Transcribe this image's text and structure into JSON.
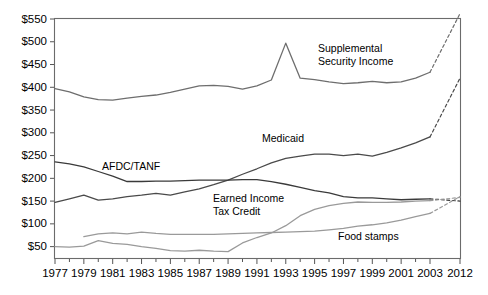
{
  "chart_data": {
    "type": "line",
    "title": "",
    "subtitle": "",
    "xlabel": "",
    "ylabel": "",
    "xlim": [
      1977,
      2012
    ],
    "ylim": [
      25,
      550
    ],
    "grid": false,
    "legend_position": "inline-labels",
    "ytick_labels": [
      "$50",
      "$100",
      "$150",
      "$200",
      "$250",
      "$300",
      "$350",
      "$400",
      "$450",
      "$500",
      "$550"
    ],
    "ytick_values": [
      50,
      100,
      150,
      200,
      250,
      300,
      350,
      400,
      450,
      500,
      550
    ],
    "xtick_labels": [
      "1977",
      "1979",
      "1981",
      "1983",
      "1985",
      "1987",
      "1989",
      "1991",
      "1993",
      "1995",
      "1997",
      "1999",
      "2001",
      "2003",
      "2012"
    ],
    "xtick_values": [
      1977,
      1979,
      1981,
      1983,
      1985,
      1987,
      1989,
      1991,
      1993,
      1995,
      1997,
      1999,
      2001,
      2003,
      2012
    ],
    "x_minor_ticks": [
      1978,
      1980,
      1982,
      1984,
      1986,
      1988,
      1990,
      1992,
      1994,
      1996,
      1998,
      2000,
      2002
    ],
    "note_projection": "Dashed segments from 2003 to 2012 are projections",
    "series": [
      {
        "name": "Supplemental Security Income",
        "label": "Supplemental Security Income",
        "color": "#6e6e6e",
        "x": [
          1977,
          1978,
          1979,
          1980,
          1981,
          1982,
          1983,
          1984,
          1985,
          1986,
          1987,
          1988,
          1989,
          1990,
          1991,
          1992,
          1993,
          1994,
          1995,
          1996,
          1997,
          1998,
          1999,
          2000,
          2001,
          2002,
          2003
        ],
        "values": [
          397,
          390,
          379,
          373,
          372,
          376,
          380,
          383,
          389,
          396,
          403,
          404,
          402,
          396,
          403,
          416,
          497,
          420,
          417,
          412,
          408,
          410,
          413,
          410,
          412,
          420,
          433
        ],
        "projection_x": [
          2003,
          2012
        ],
        "projection_values": [
          433,
          562
        ]
      },
      {
        "name": "Medicaid",
        "label": "Medicaid",
        "color": "#4a4a4a",
        "x": [
          1977,
          1978,
          1979,
          1980,
          1981,
          1982,
          1983,
          1984,
          1985,
          1986,
          1987,
          1988,
          1989,
          1990,
          1991,
          1992,
          1993,
          1994,
          1995,
          1996,
          1997,
          1998,
          1999,
          2000,
          2001,
          2002,
          2003
        ],
        "values": [
          147,
          155,
          163,
          152,
          155,
          160,
          163,
          167,
          163,
          170,
          177,
          186,
          196,
          209,
          221,
          234,
          244,
          249,
          253,
          253,
          250,
          253,
          249,
          257,
          267,
          278,
          291
        ],
        "projection_x": [
          2003,
          2012
        ],
        "projection_values": [
          291,
          420
        ]
      },
      {
        "name": "AFDC/TANF",
        "label": "AFDC/TANF",
        "color": "#3a3a3a",
        "x": [
          1977,
          1978,
          1979,
          1980,
          1981,
          1982,
          1983,
          1984,
          1985,
          1986,
          1987,
          1988,
          1989,
          1990,
          1991,
          1992,
          1993,
          1994,
          1995,
          1996,
          1997,
          1998,
          1999,
          2000,
          2001,
          2002,
          2003
        ],
        "values": [
          236,
          232,
          225,
          215,
          205,
          193,
          193,
          194,
          194,
          195,
          196,
          196,
          196,
          197,
          197,
          193,
          187,
          180,
          173,
          168,
          160,
          157,
          157,
          155,
          153,
          154,
          155
        ],
        "projection_x": [
          2003,
          2012
        ],
        "projection_values": [
          155,
          150
        ]
      },
      {
        "name": "Earned Income Tax Credit",
        "label": "Earned Income Tax Credit",
        "color": "#9a9a9a",
        "x": [
          1977,
          1978,
          1979,
          1980,
          1981,
          1982,
          1983,
          1984,
          1985,
          1986,
          1987,
          1988,
          1989,
          1990,
          1991,
          1992,
          1993,
          1994,
          1995,
          1996,
          1997,
          1998,
          1999,
          2000,
          2001,
          2002,
          2003
        ],
        "values": [
          50,
          49,
          51,
          63,
          57,
          55,
          50,
          46,
          41,
          40,
          42,
          40,
          39,
          58,
          70,
          80,
          96,
          118,
          132,
          140,
          145,
          148,
          147,
          147,
          148,
          150,
          151
        ],
        "projection_x": [
          2003,
          2012
        ],
        "projection_values": [
          151,
          158
        ]
      },
      {
        "name": "Food stamps",
        "label": "Food stamps",
        "color": "#9a9a9a",
        "x": [
          1979,
          1980,
          1981,
          1982,
          1983,
          1984,
          1985,
          1986,
          1987,
          1988,
          1989,
          1990,
          1991,
          1992,
          1993,
          1994,
          1995,
          1996,
          1997,
          1998,
          1999,
          2000,
          2001,
          2002,
          2003
        ],
        "values": [
          72,
          78,
          80,
          78,
          82,
          79,
          77,
          77,
          77,
          77,
          78,
          79,
          80,
          81,
          82,
          83,
          84,
          87,
          90,
          95,
          98,
          102,
          108,
          116,
          123
        ],
        "projection_x": [
          2003,
          2012
        ],
        "projection_values": [
          123,
          160
        ]
      }
    ],
    "annotations": [
      {
        "text": "Supplemental",
        "x": 318,
        "y": 52
      },
      {
        "text": "Security Income",
        "x": 318,
        "y": 65
      },
      {
        "text": "Medicaid",
        "x": 262,
        "y": 142
      },
      {
        "text": "AFDC/TANF",
        "x": 102,
        "y": 170
      },
      {
        "text": "Earned Income",
        "x": 213,
        "y": 202
      },
      {
        "text": "Tax Credit",
        "x": 213,
        "y": 215
      },
      {
        "text": "Food stamps",
        "x": 338,
        "y": 240
      }
    ]
  }
}
